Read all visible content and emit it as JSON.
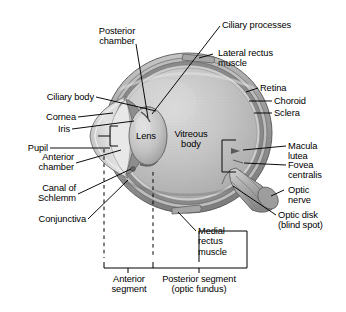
{
  "figure": {
    "background": "#ffffff",
    "ink": "#000000"
  },
  "palette": {
    "sclera_outer": "#8f8f8f",
    "sclera_mid": "#a8a8a8",
    "choroid": "#6f6f6f",
    "retina": "#cfcfcf",
    "vitreous": "#bcbcbc",
    "vitreous_light": "#d2d2d2",
    "cornea": "#dcdcdc",
    "lens": "#c4c4c4",
    "nerve": "#b0b0b0",
    "nerve_dark": "#7d7d7d",
    "muscle": "#9a9a9a",
    "highlight": "#e6e6e6"
  },
  "labels": {
    "posterior_chamber": "Posterior\nchamber",
    "ciliary_processes": "Ciliary processes",
    "lateral_rectus_muscle": "Lateral rectus\nmuscle",
    "retina": "Retina",
    "choroid": "Choroid",
    "sclera": "Sclera",
    "ciliary_body": "Ciliary body",
    "cornea": "Cornea",
    "iris": "Iris",
    "pupil": "Pupil",
    "anterior_chamber": "Anterior\nchamber",
    "canal_of_schlemm": "Canal of\nSchlemm",
    "conjunctiva": "Conjunctiva",
    "lens": "Lens",
    "vitreous_body": "Vitreous\nbody",
    "macula_lutea": "Macula\nlutea",
    "fovea_centralis": "Fovea\ncentralis",
    "optic_nerve": "Optic\nnerve",
    "optic_disk": "Optic disk\n(blind spot)",
    "medial_rectus_muscle": "Medial\nrectus\nmuscle",
    "anterior_segment": "Anterior\nsegment",
    "posterior_segment": "Posterior segment\n(optic fundus)"
  }
}
